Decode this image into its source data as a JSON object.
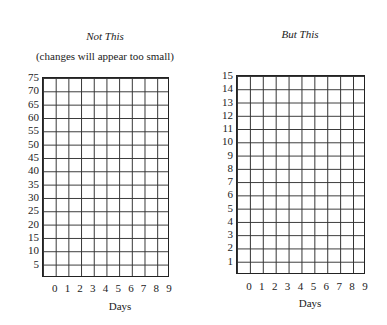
{
  "chart_data": [
    {
      "type": "table",
      "title": "Not This",
      "subtitle": "(changes will appear too small)",
      "xlabel": "Days",
      "ylabel": "",
      "x_ticks": [
        "0",
        "1",
        "2",
        "3",
        "4",
        "5",
        "6",
        "7",
        "8",
        "9"
      ],
      "y_ticks": [
        "5",
        "10",
        "15",
        "20",
        "25",
        "30",
        "35",
        "40",
        "45",
        "50",
        "55",
        "60",
        "65",
        "70",
        "75"
      ],
      "ylim": [
        0,
        75
      ],
      "grid": true,
      "columns": 10,
      "rows": 15
    },
    {
      "type": "table",
      "title": "But This",
      "subtitle": "",
      "xlabel": "Days",
      "ylabel": "",
      "x_ticks": [
        "0",
        "1",
        "2",
        "3",
        "4",
        "5",
        "6",
        "7",
        "8",
        "9"
      ],
      "y_ticks": [
        "1",
        "2",
        "3",
        "4",
        "5",
        "6",
        "7",
        "8",
        "9",
        "10",
        "11",
        "12",
        "13",
        "14",
        "15"
      ],
      "ylim": [
        0,
        15
      ],
      "grid": true,
      "columns": 10,
      "rows": 15
    }
  ]
}
